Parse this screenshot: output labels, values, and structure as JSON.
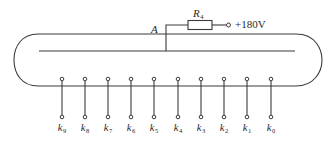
{
  "diagram": {
    "type": "glow-discharge counter tube schematic",
    "anode": {
      "label": "A"
    },
    "resistor": {
      "symbol": "R",
      "subscript": "4"
    },
    "supply": {
      "voltage_label": "+180V"
    },
    "cathodes": [
      {
        "symbol": "k",
        "subscript": "9",
        "x": 62
      },
      {
        "symbol": "k",
        "subscript": "8",
        "x": 85
      },
      {
        "symbol": "k",
        "subscript": "7",
        "x": 108
      },
      {
        "symbol": "k",
        "subscript": "6",
        "x": 131
      },
      {
        "symbol": "k",
        "subscript": "5",
        "x": 154
      },
      {
        "symbol": "k",
        "subscript": "4",
        "x": 178
      },
      {
        "symbol": "k",
        "subscript": "3",
        "x": 201
      },
      {
        "symbol": "k",
        "subscript": "2",
        "x": 224
      },
      {
        "symbol": "k",
        "subscript": "1",
        "x": 247
      },
      {
        "symbol": "k",
        "subscript": "0",
        "x": 271
      }
    ],
    "colors": {
      "line": "#3a3a3a",
      "text": "#2a2a2a",
      "background": "#ffffff"
    }
  }
}
